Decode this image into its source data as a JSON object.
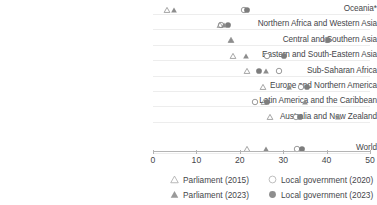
{
  "chart_data": {
    "type": "scatter",
    "title": "",
    "xlabel": "",
    "ylabel": "",
    "xlim": [
      0,
      50
    ],
    "grid": false,
    "legend_position": "bottom",
    "categories": [
      "Oceania*",
      "Northern Africa and Western Asia",
      "Central and Southern Asia",
      "Eastern and South-Eastern Asia",
      "Sub-Saharan Africa",
      "Europe and Northern America",
      "Latin America and the Caribbean",
      "Australia and New Zealand",
      "World"
    ],
    "xticks": [
      0,
      10,
      20,
      30,
      40,
      50
    ],
    "xticklabels": [
      "0",
      "10",
      "20",
      "30",
      "40",
      "50"
    ],
    "series": [
      {
        "name": "Parliament (2015)",
        "marker": "triangle-open",
        "color": "#8d8d8d",
        "values": [
          3.2,
          15.4,
          17.9,
          18.4,
          21.7,
          25.3,
          25.6,
          26.9,
          21.6
        ]
      },
      {
        "name": "Parliament (2023)",
        "marker": "triangle-filled",
        "color": "#8d8d8d",
        "values": [
          4.8,
          16.4,
          18.0,
          21.4,
          26.0,
          31.3,
          35.0,
          42.6,
          26.0
        ]
      },
      {
        "name": "Local government (2020)",
        "marker": "circle-open",
        "color": "#7d7d7d",
        "values": [
          21.0,
          15.7,
          40.0,
          26.3,
          29.0,
          34.1,
          23.5,
          33.0,
          33.2
        ]
      },
      {
        "name": "Local government (2023)",
        "marker": "circle-filled",
        "color": "#7d7d7d",
        "values": [
          21.7,
          17.3,
          40.3,
          30.2,
          24.4,
          35.5,
          26.3,
          33.8,
          34.3
        ]
      }
    ]
  },
  "legend": {
    "entries": [
      {
        "label": "Parliament (2015)",
        "icon": "triangle-open-icon"
      },
      {
        "label": "Local government (2020)",
        "icon": "circle-open-icon"
      },
      {
        "label": "Parliament (2023)",
        "icon": "triangle-filled-icon"
      },
      {
        "label": "Local government (2023)",
        "icon": "circle-filled-icon"
      }
    ]
  },
  "colors": {
    "marker_gray": "#8a8a8a",
    "marker_open": "#a8a8a8",
    "axis": "#b4b4b4",
    "band": "#ededed",
    "text": "#45464a"
  }
}
